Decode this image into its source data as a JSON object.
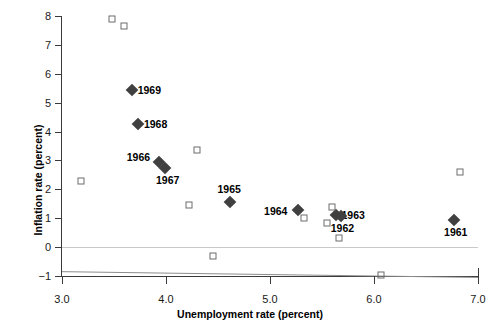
{
  "chart_data": {
    "type": "scatter",
    "title": "",
    "xlabel": "Unemployment rate (percent)",
    "ylabel": "Inflation rate (percent)",
    "xlim": [
      3.0,
      7.0
    ],
    "ylim": [
      -1,
      8
    ],
    "xticks": [
      "3.0",
      "4.0",
      "5.0",
      "6.0",
      "7.0"
    ],
    "yticks": [
      "8",
      "7",
      "6",
      "5",
      "4",
      "3",
      "2",
      "1",
      "0",
      "-1"
    ],
    "grid": false,
    "legend": null,
    "zero_reference_line": 0,
    "trend_line": {
      "x1": 3.0,
      "y1": -0.85,
      "x2": 7.0,
      "y2": -1.05
    },
    "series": [
      {
        "name": "labeled-years",
        "marker": "filled-diamond",
        "color": "#404040",
        "points": [
          {
            "label": "1969",
            "x": 3.67,
            "y": 5.45,
            "label_pos": "right"
          },
          {
            "label": "1968",
            "x": 3.73,
            "y": 4.25,
            "label_pos": "right"
          },
          {
            "label": "1966",
            "x": 3.93,
            "y": 2.95,
            "label_pos": "upper-left"
          },
          {
            "label": "1967",
            "x": 3.99,
            "y": 2.75,
            "label_pos": "lower-right"
          },
          {
            "label": "1965",
            "x": 4.62,
            "y": 1.55,
            "label_pos": "above"
          },
          {
            "label": "1964",
            "x": 5.27,
            "y": 1.28,
            "label_pos": "left"
          },
          {
            "label": "1963",
            "x": 5.63,
            "y": 1.1,
            "label_pos": "right"
          },
          {
            "label": "1962",
            "x": 5.68,
            "y": 1.08,
            "label_pos": "below"
          },
          {
            "label": "1961",
            "x": 6.77,
            "y": 0.95,
            "label_pos": "below"
          }
        ]
      },
      {
        "name": "other-years",
        "marker": "open-square",
        "color": "#6d6d6d",
        "points": [
          {
            "x": 3.48,
            "y": 7.9
          },
          {
            "x": 3.6,
            "y": 7.65
          },
          {
            "x": 3.18,
            "y": 2.3
          },
          {
            "x": 4.3,
            "y": 3.35
          },
          {
            "x": 4.22,
            "y": 1.45
          },
          {
            "x": 5.33,
            "y": 1.0
          },
          {
            "x": 5.6,
            "y": 1.4
          },
          {
            "x": 5.55,
            "y": 0.85
          },
          {
            "x": 5.66,
            "y": 0.3
          },
          {
            "x": 6.83,
            "y": 2.6
          },
          {
            "x": 4.45,
            "y": -0.32
          },
          {
            "x": 6.07,
            "y": -0.95
          }
        ]
      }
    ]
  }
}
